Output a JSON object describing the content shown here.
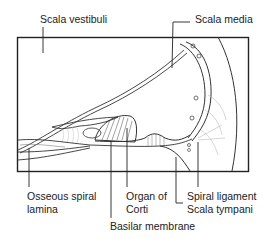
{
  "diagram": {
    "labels": {
      "scala_vestibuli": "Scala vestibuli",
      "scala_media": "Scala media",
      "osseous_spiral_lamina_line1": "Osseous spiral",
      "osseous_spiral_lamina_line2": "lamina",
      "organ_of_corti_line1": "Organ of",
      "organ_of_corti_line2": "Corti",
      "spiral_ligament": "Spiral ligament",
      "scala_tympani": "Scala tympani",
      "basilar_membrane": "Basilar membrane"
    }
  }
}
